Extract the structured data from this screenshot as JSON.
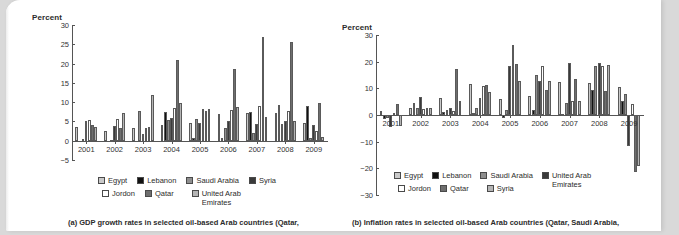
{
  "page": {
    "background_color": "#d9d9d9",
    "sheet_color": "#ffffff"
  },
  "figures": [
    {
      "id": "a",
      "caption": "(a) GDP growth rates in selected oil-based Arab countries (Qatar,",
      "chart_data": {
        "type": "bar",
        "title": "",
        "xlabel": "",
        "ylabel": "Percent",
        "ylim": [
          -5,
          30
        ],
        "yticks": [
          -5,
          0,
          5,
          10,
          15,
          20,
          25,
          30
        ],
        "grid": false,
        "legend_position": "bottom",
        "legend_order": [
          "Egypt",
          "Lebanon",
          "Saudi Arabia",
          "Syria",
          "Jordon",
          "Qatar",
          "United Arab\nEmirates"
        ],
        "categories": [
          "2001",
          "2002",
          "2003",
          "2004",
          "2005",
          "2006",
          "2007",
          "2008",
          "2009"
        ],
        "series": [
          {
            "name": "Egypt",
            "color": "#c9c9c9",
            "values": [
              3.5,
              2.4,
              3.2,
              4.2,
              4.5,
              6.8,
              7.1,
              7.2,
              4.7
            ]
          },
          {
            "name": "Lebanon",
            "color": "#111111",
            "values": [
              0.0,
              0.0,
              0.0,
              7.5,
              0.8,
              0.6,
              7.5,
              9.3,
              9.0
            ]
          },
          {
            "name": "Saudi Arabia",
            "color": "#8f8f8f",
            "values": [
              0.5,
              0.1,
              7.7,
              5.3,
              5.6,
              3.2,
              2.0,
              4.4,
              0.6
            ]
          },
          {
            "name": "Syria",
            "color": "#3a3a3a",
            "values": [
              5.1,
              3.9,
              1.7,
              6.0,
              4.5,
              5.2,
              4.3,
              5.2,
              4.2
            ]
          },
          {
            "name": "Jordon",
            "color": "#ffffff",
            "values": [
              5.3,
              5.7,
              3.3,
              8.6,
              8.1,
              8.0,
              8.9,
              7.8,
              2.4
            ]
          },
          {
            "name": "Qatar",
            "color": "#6e6e6e",
            "values": [
              4.0,
              3.4,
              3.6,
              20.8,
              7.6,
              18.6,
              26.8,
              25.6,
              9.9
            ]
          },
          {
            "name": "United Arab\nEmirates",
            "color": "#b5b5b5",
            "values": [
              3.5,
              7.1,
              11.9,
              9.7,
              8.2,
              8.7,
              6.2,
              5.1,
              0.9
            ]
          }
        ]
      }
    },
    {
      "id": "b",
      "caption": "(b) Inflation rates in selected oil-based Arab countries (Qatar, Saudi Arabia,",
      "chart_data": {
        "type": "bar",
        "title": "",
        "xlabel": "",
        "ylabel": "Percent",
        "ylim": [
          -30,
          30
        ],
        "yticks": [
          -30,
          -20,
          -10,
          0,
          10,
          20,
          30
        ],
        "grid": false,
        "legend_position": "bottom",
        "legend_order": [
          "Egypt",
          "Lebanon",
          "Saudi Arabia",
          "United Arab\nEmirates",
          "Jordon",
          "Qatar",
          "Syria"
        ],
        "categories": [
          "2001",
          "2002",
          "2003",
          "2004",
          "2005",
          "2006",
          "2007",
          "2008",
          "2009"
        ],
        "series": [
          {
            "name": "Egypt",
            "color": "#c9c9c9",
            "values": [
              1.6,
              2.8,
              6.5,
              11.5,
              6.0,
              7.2,
              12.3,
              12.1,
              10.6
            ]
          },
          {
            "name": "Lebanon",
            "color": "#111111",
            "values": [
              -1.5,
              4.6,
              1.3,
              0.6,
              -1.0,
              1.9,
              0.4,
              9.2,
              5.4
            ]
          },
          {
            "name": "Saudi Arabia",
            "color": "#8f8f8f",
            "values": [
              -1.2,
              2.5,
              1.9,
              2.7,
              2.0,
              15.0,
              4.4,
              18.5,
              7.9
            ]
          },
          {
            "name": "United Arab\nEmirates",
            "color": "#3a3a3a",
            "values": [
              -4.5,
              6.6,
              2.5,
              6.5,
              18.3,
              12.7,
              19.6,
              19.5,
              -11.7
            ]
          },
          {
            "name": "Jordon",
            "color": "#ffffff",
            "values": [
              0.6,
              2.4,
              1.4,
              10.9,
              26.2,
              18.2,
              5.4,
              18.3,
              4.0
            ]
          },
          {
            "name": "Qatar",
            "color": "#6e6e6e",
            "values": [
              4.2,
              2.5,
              17.4,
              11.1,
              19.3,
              9.2,
              13.5,
              9.1,
              -21.3
            ]
          },
          {
            "name": "Syria",
            "color": "#b5b5b5",
            "values": [
              -4.3,
              2.5,
              5.4,
              8.5,
              12.8,
              12.7,
              5.2,
              18.9,
              -19.0
            ]
          }
        ]
      }
    }
  ]
}
